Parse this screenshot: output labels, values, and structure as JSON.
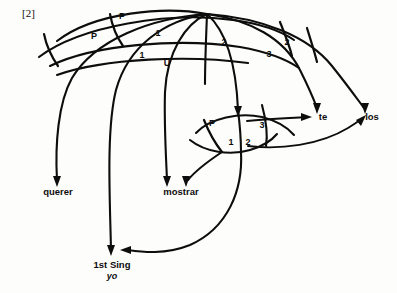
{
  "figure": {
    "example_number": "[2]",
    "background_color": "#fdfdfc",
    "line_color": "#0d0d0d",
    "type": "relational-network-stratal-diagram"
  },
  "terminal_nodes": [
    {
      "id": "querer",
      "label": "querer",
      "x": 58,
      "y": 192
    },
    {
      "id": "mostrar",
      "label": "mostrar",
      "x": 180,
      "y": 192
    },
    {
      "id": "te",
      "label": "te",
      "x": 322,
      "y": 117
    },
    {
      "id": "los",
      "label": "los",
      "x": 371,
      "y": 117
    },
    {
      "id": "first_sing",
      "label": "1st Sing",
      "x": 112,
      "y": 265
    },
    {
      "id": "yo",
      "label": "yo",
      "x": 112,
      "y": 276
    }
  ],
  "relation_labels": [
    {
      "id": "upper-p-left",
      "text": "P",
      "x": 40,
      "y": 40
    },
    {
      "id": "upper-p-right",
      "text": "P",
      "x": 142,
      "y": 19
    },
    {
      "id": "upper-one-right",
      "text": "1",
      "x": 158,
      "y": 34
    },
    {
      "id": "upper-one-left",
      "text": "1",
      "x": 47,
      "y": 53
    },
    {
      "id": "upper-u",
      "text": "U",
      "x": 57,
      "y": 61
    },
    {
      "id": "upper-two-mid",
      "text": "2",
      "x": 74,
      "y": 40
    },
    {
      "id": "upper-two-right",
      "text": "2",
      "x": 86,
      "y": 40
    },
    {
      "id": "upper-three",
      "text": "3",
      "x": 70,
      "y": 56
    },
    {
      "id": "lower-p",
      "text": "P",
      "x": 71,
      "y": 120
    },
    {
      "id": "lower-one",
      "text": "1",
      "x": 76,
      "y": 144
    },
    {
      "id": "lower-two",
      "text": "2",
      "x": 83,
      "y": 145
    },
    {
      "id": "lower-three",
      "text": "3",
      "x": 89,
      "y": 127
    }
  ],
  "icons": {
    "arrowhead": "arrowhead-icon"
  }
}
